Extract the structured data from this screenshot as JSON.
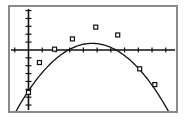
{
  "window": {
    "title": "Graphing Calculator Plot",
    "frame_border_color": "#8a8a8a",
    "background_color": "#ffffff",
    "ink_color": "#111111"
  },
  "chart_data": {
    "type": "scatter",
    "title": "",
    "subtitle": "",
    "xlabel": "",
    "ylabel": "",
    "grid": false,
    "legend": null,
    "axis_style": "calculator-crosshair",
    "xlim": [
      -1.2,
      10.6
    ],
    "ylim": [
      -7.5,
      5.2
    ],
    "x_axis_position_y": 0,
    "y_axis_position_x": 0,
    "x_tick_count": 12,
    "x_ticks": [
      -1,
      0,
      1,
      2,
      3,
      4,
      5,
      6,
      7,
      8,
      9,
      10
    ],
    "y_tick_count": 13,
    "y_ticks": [
      -7,
      -6,
      -5,
      -4,
      -3,
      -2,
      -1,
      0,
      1,
      2,
      3,
      4,
      5
    ],
    "tick_labels_visible": false,
    "marker_shape": "square",
    "marker_size_px": 4,
    "series": [
      {
        "name": "Data",
        "kind": "scatter",
        "x": [
          0.0,
          0.8,
          1.9,
          3.2,
          4.9,
          6.5,
          8.1,
          9.2
        ],
        "y": [
          -5.4,
          -1.6,
          0.1,
          1.4,
          2.9,
          1.9,
          -2.4,
          -4.4
        ],
        "points_px": [
          {
            "x": 30,
            "y": 93
          },
          {
            "x": 39,
            "y": 60
          },
          {
            "x": 53,
            "y": 47
          },
          {
            "x": 72,
            "y": 36
          },
          {
            "x": 97,
            "y": 23
          },
          {
            "x": 116,
            "y": 32
          },
          {
            "x": 144,
            "y": 76
          },
          {
            "x": 160,
            "y": 93
          }
        ]
      },
      {
        "name": "Quadratic regression",
        "kind": "curve",
        "equation": "y = -0.28x^2 + 2.6x - 5.2",
        "a": -0.28,
        "b": 2.6,
        "c": -5.2,
        "opens": "down",
        "vertex_px": {
          "x": 97,
          "y": 21
        }
      }
    ]
  }
}
